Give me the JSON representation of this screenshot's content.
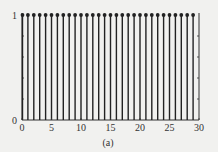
{
  "chart_data": {
    "type": "stem",
    "title": "",
    "caption": "(a)",
    "xlabel": "",
    "ylabel": "",
    "xlim": [
      0,
      30
    ],
    "ylim": [
      0,
      1
    ],
    "xticks": [
      0,
      5,
      10,
      15,
      20,
      25,
      30
    ],
    "yticks": [
      0,
      1
    ],
    "grid": false,
    "legend": null,
    "x": [
      0,
      1,
      2,
      3,
      4,
      5,
      6,
      7,
      8,
      9,
      10,
      11,
      12,
      13,
      14,
      15,
      16,
      17,
      18,
      19,
      20,
      21,
      22,
      23,
      24,
      25,
      26,
      27,
      28,
      29
    ],
    "values": [
      1,
      1,
      1,
      1,
      1,
      1,
      1,
      1,
      1,
      1,
      1,
      1,
      1,
      1,
      1,
      1,
      1,
      1,
      1,
      1,
      1,
      1,
      1,
      1,
      1,
      1,
      1,
      1,
      1,
      1
    ],
    "colors": {
      "stem": "#222222",
      "axis": "#333333",
      "background": "#f1f1ef"
    }
  }
}
